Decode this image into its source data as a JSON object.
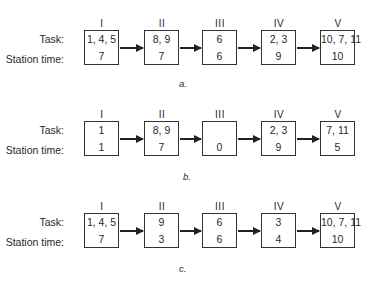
{
  "labels": {
    "task": "Task:",
    "station_time": "Station time:"
  },
  "stations": [
    "I",
    "II",
    "III",
    "IV",
    "V"
  ],
  "diagrams": [
    {
      "caption": "a.",
      "boxes": [
        {
          "station": "I",
          "tasks": "1, 4, 5",
          "time": "7"
        },
        {
          "station": "II",
          "tasks": "8, 9",
          "time": "7"
        },
        {
          "station": "III",
          "tasks": "6",
          "time": "6"
        },
        {
          "station": "IV",
          "tasks": "2, 3",
          "time": "9"
        },
        {
          "station": "V",
          "tasks": "10, 7, 11",
          "time": "10"
        }
      ]
    },
    {
      "caption": "b.",
      "boxes": [
        {
          "station": "I",
          "tasks": "1",
          "time": "1"
        },
        {
          "station": "II",
          "tasks": "8, 9",
          "time": "7"
        },
        {
          "station": "III",
          "tasks": "",
          "time": "0"
        },
        {
          "station": "IV",
          "tasks": "2, 3",
          "time": "9"
        },
        {
          "station": "V",
          "tasks": "7, 11",
          "time": "5"
        }
      ]
    },
    {
      "caption": "c.",
      "boxes": [
        {
          "station": "I",
          "tasks": "1, 4, 5",
          "time": "7"
        },
        {
          "station": "II",
          "tasks": "9",
          "time": "3"
        },
        {
          "station": "III",
          "tasks": "6",
          "time": "6"
        },
        {
          "station": "IV",
          "tasks": "3",
          "time": "4"
        },
        {
          "station": "V",
          "tasks": "10, 7, 11",
          "time": "10"
        }
      ]
    }
  ]
}
